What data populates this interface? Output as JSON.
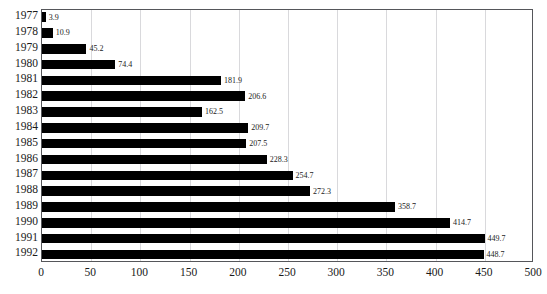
{
  "chart_data": {
    "type": "bar",
    "orientation": "horizontal",
    "title": "",
    "xlabel": "",
    "ylabel": "",
    "categories": [
      "1977",
      "1978",
      "1979",
      "1980",
      "1981",
      "1982",
      "1983",
      "1984",
      "1985",
      "1986",
      "1987",
      "1988",
      "1989",
      "1990",
      "1991",
      "1992"
    ],
    "values": [
      3.9,
      10.9,
      45.2,
      74.4,
      181.9,
      206.6,
      162.5,
      209.7,
      207.5,
      228.3,
      254.7,
      272.3,
      358.7,
      414.7,
      449.7,
      448.7
    ],
    "value_labels": [
      "3.9",
      "10.9",
      "45.2",
      "74.4",
      "181.9",
      "206.6",
      "162.5",
      "209.7",
      "207.5",
      "228.3",
      "254.7",
      "272.3",
      "358.7",
      "414.7",
      "449.7",
      "448.7"
    ],
    "xlim": [
      0,
      500
    ],
    "xticks": [
      0,
      50,
      100,
      150,
      200,
      250,
      300,
      350,
      400,
      450,
      500
    ],
    "xtick_labels": [
      "0",
      "50",
      "100",
      "150",
      "200",
      "250",
      "300",
      "350",
      "400",
      "450",
      "500"
    ],
    "grid": "vertical",
    "legend": null,
    "bar_color": "#000000",
    "gridline_color": "#d9d9dc",
    "frame_color": "#55565a",
    "background_color": "#ffffff",
    "text_color": "#1a1a1a"
  }
}
